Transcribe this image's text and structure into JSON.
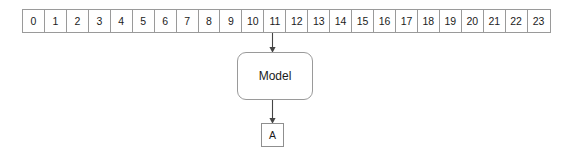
{
  "diagram": {
    "title": "",
    "type": "token-sequence-model-prediction",
    "colors": {
      "background": "#ffffff",
      "cell_border": "#9a9a9a",
      "box_border": "#9a9a9a",
      "text": "#1b1b1b",
      "arrow": "#444444"
    },
    "token_strip": {
      "name": "token-index-strip",
      "cells": [
        "0",
        "1",
        "2",
        "3",
        "4",
        "5",
        "6",
        "7",
        "8",
        "9",
        "10",
        "11",
        "12",
        "13",
        "14",
        "15",
        "16",
        "17",
        "18",
        "19",
        "20",
        "21",
        "22",
        "23"
      ],
      "highlighted_index": 11
    },
    "model_node": {
      "name": "model-box",
      "label": "Model"
    },
    "output_node": {
      "name": "output-box",
      "label": "A"
    },
    "edges": [
      {
        "name": "edge-token11-to-model",
        "from": "11",
        "to": "Model",
        "label": ""
      },
      {
        "name": "edge-model-to-output",
        "from": "Model",
        "to": "A",
        "label": ""
      }
    ]
  }
}
